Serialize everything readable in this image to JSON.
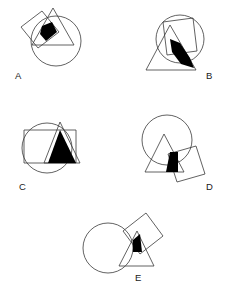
{
  "figure": {
    "background_color": "#ffffff",
    "stroke_color": "#3a3a3a",
    "overlap_fill_color": "#000000",
    "width": 228,
    "height": 290
  },
  "panels": [
    {
      "id": "A",
      "label": "A",
      "label_x": 15,
      "label_y": 79,
      "shapes": {
        "circle": {
          "cx": 56,
          "cy": 41,
          "r": 25
        },
        "square": {
          "points": "21,27 42,11 59,32 38,48"
        },
        "triangle": {
          "points": "53,8 74,45 32,45"
        }
      },
      "overlap": {
        "points": "42,26 52,22 57,32 46,41 40,34"
      }
    },
    {
      "id": "B",
      "label": "B",
      "label_x": 206,
      "label_y": 79,
      "shapes": {
        "circle": {
          "cx": 180,
          "cy": 39,
          "r": 24
        },
        "square": {
          "points": "163,22 193,18 197,51 167,55"
        },
        "triangle": {
          "points": "170,25 196,70 146,70"
        }
      },
      "overlap": {
        "points": "170,39 180,43 190,58 194,68 181,64 172,52"
      }
    },
    {
      "id": "C",
      "label": "C",
      "label_x": 19,
      "label_y": 190,
      "shapes": {
        "circle": {
          "cx": 47,
          "cy": 148,
          "r": 25
        },
        "square": {
          "points": "24,130 76,130 76,163 24,163"
        },
        "triangle": {
          "points": "60,122 80,163 44,163"
        }
      },
      "overlap": {
        "points": "60,130 76,163 48,163"
      }
    },
    {
      "id": "D",
      "label": "D",
      "label_x": 206,
      "label_y": 190,
      "shapes": {
        "circle": {
          "cx": 167,
          "cy": 140,
          "r": 25
        },
        "square": {
          "points": "168,154 196,146 205,174 177,182"
        },
        "triangle": {
          "points": "164,134 184,172 145,172"
        }
      },
      "overlap": {
        "points": "170,152 178,152 178,172 166,172"
      }
    },
    {
      "id": "E",
      "label": "E",
      "label_x": 135,
      "label_y": 281,
      "shapes": {
        "circle": {
          "cx": 108,
          "cy": 248,
          "r": 25
        },
        "square": {
          "points": "123,231 146,213 163,236 140,254"
        },
        "triangle": {
          "points": "137,231 154,266 119,266"
        }
      },
      "overlap": {
        "points": "133,240 140,234 142,252 133,252"
      }
    }
  ]
}
